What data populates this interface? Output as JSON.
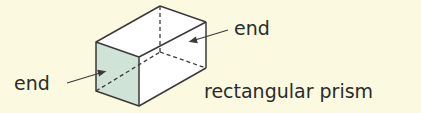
{
  "diagram": {
    "title": "rectangular prism",
    "labels": {
      "left_end": "end",
      "right_end": "end",
      "shape_name": "rectangular prism"
    },
    "colors": {
      "background": "#fbfae0",
      "end_face_fill": "#cfe3d6",
      "edge": "#3a3a3a",
      "text": "#2b2b2b"
    }
  }
}
